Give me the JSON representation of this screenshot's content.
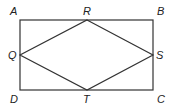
{
  "diagram": {
    "type": "geometry",
    "rectangle": {
      "vertices": [
        {
          "name": "A",
          "x": 20,
          "y": 20
        },
        {
          "name": "B",
          "x": 153,
          "y": 20
        },
        {
          "name": "C",
          "x": 153,
          "y": 90
        },
        {
          "name": "D",
          "x": 20,
          "y": 90
        }
      ]
    },
    "rhombus": {
      "vertices": [
        {
          "name": "R",
          "x": 87,
          "y": 20
        },
        {
          "name": "S",
          "x": 153,
          "y": 55
        },
        {
          "name": "T",
          "x": 87,
          "y": 90
        },
        {
          "name": "Q",
          "x": 20,
          "y": 55
        }
      ]
    },
    "labels": {
      "A": "A",
      "B": "B",
      "C": "C",
      "D": "D",
      "Q": "Q",
      "R": "R",
      "S": "S",
      "T": "T"
    },
    "stroke_color": "#333333"
  }
}
